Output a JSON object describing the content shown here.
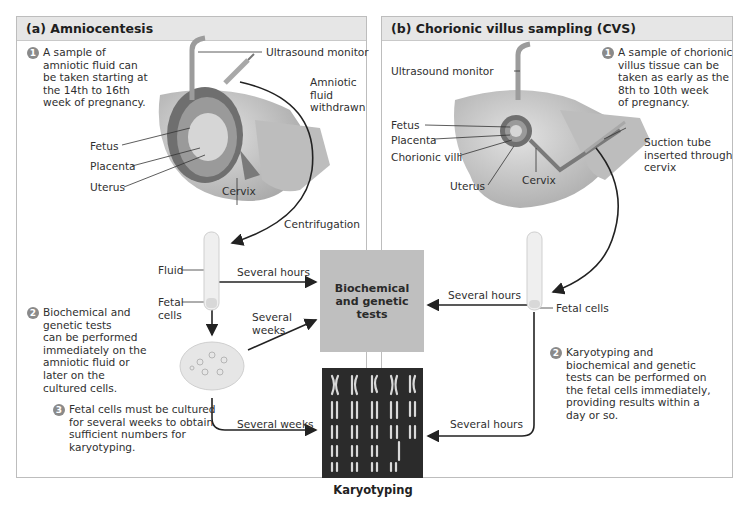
{
  "panels": {
    "a": {
      "title": "(a) Amniocentesis",
      "labels": {
        "ultrasound": "Ultrasound monitor",
        "withdrawn": "Amniotic\nfluid\nwithdrawn",
        "fetus": "Fetus",
        "placenta": "Placenta",
        "uterus": "Uterus",
        "cervix": "Cervix",
        "centrifugation": "Centrifugation",
        "fluid": "Fluid",
        "fetal_cells": "Fetal\ncells",
        "several_hours": "Several hours",
        "several_weeks_upper": "Several\nweeks",
        "several_weeks_lower": "Several weeks"
      },
      "steps": [
        {
          "num": "1",
          "text": "A sample of\namniotic fluid can\nbe taken starting at\nthe 14th to 16th\nweek of pregnancy."
        },
        {
          "num": "2",
          "text": "Biochemical and\ngenetic tests\ncan be performed\nimmediately on the\namniotic fluid or\nlater on the\ncultured cells."
        },
        {
          "num": "3",
          "text": "Fetal cells must be cultured\nfor several weeks to obtain\nsufficient numbers for\nkaryotyping."
        }
      ]
    },
    "b": {
      "title": "(b) Chorionic villus sampling (CVS)",
      "labels": {
        "ultrasound": "Ultrasound monitor",
        "fetus": "Fetus",
        "placenta": "Placenta",
        "chorionic_villi": "Chorionic villi",
        "uterus": "Uterus",
        "cervix": "Cervix",
        "suction": "Suction tube\ninserted through\ncervix",
        "fetal_cells": "Fetal cells",
        "several_hours_upper": "Several hours",
        "several_hours_lower": "Several hours"
      },
      "steps": [
        {
          "num": "1",
          "text": "A sample of chorionic\nvillus tissue can be\ntaken as early as the\n8th to 10th week\nof pregnancy."
        },
        {
          "num": "2",
          "text": "Karyotyping and\nbiochemical and genetic\ntests can be performed on\nthe fetal cells immediately,\nproviding results within a\nday or so."
        }
      ]
    }
  },
  "center": {
    "tests_box": "Biochemical\nand genetic\ntests",
    "karyotyping_label": "Karyotyping"
  },
  "colors": {
    "header_bg": "#e6e6e6",
    "tests_box_bg": "#bfbfbf",
    "karyotype_bg": "#2b2b2b",
    "badge": "#8a8a8a",
    "arrow": "#222222"
  }
}
